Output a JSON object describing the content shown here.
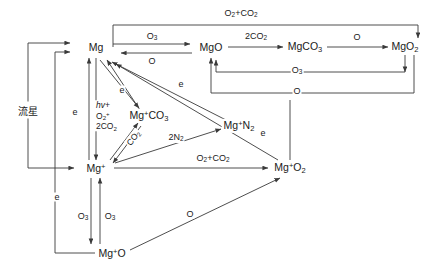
{
  "diagram": {
    "background_color": "#ffffff",
    "line_color": "#3a3a3a",
    "text_color": "#1a1a1a",
    "nodes": [
      {
        "id": "mg",
        "label": "Mg",
        "x": 96,
        "y": 47
      },
      {
        "id": "mgo",
        "label": "MgO",
        "x": 211,
        "y": 47
      },
      {
        "id": "mgco3",
        "label": "MgCO3",
        "x": 305,
        "y": 47
      },
      {
        "id": "mgo2",
        "label": "MgO2",
        "x": 405,
        "y": 47
      },
      {
        "id": "mgpco3",
        "label": "Mg+CO3",
        "x": 149,
        "y": 116
      },
      {
        "id": "mgpn2",
        "label": "Mg+N2",
        "x": 239,
        "y": 126
      },
      {
        "id": "mgp",
        "label": "Mg+",
        "x": 96,
        "y": 168
      },
      {
        "id": "mgpo2",
        "label": "Mg+O2",
        "x": 290,
        "y": 168
      },
      {
        "id": "mgpo",
        "label": "Mg+O",
        "x": 112,
        "y": 253
      }
    ],
    "meteor_label": "流星",
    "edge_labels": [
      {
        "id": "top-o2co2",
        "label": "O2+CO2",
        "x": 241,
        "y": 14
      },
      {
        "id": "mg-mgo",
        "label": "O3",
        "x": 152,
        "y": 38
      },
      {
        "id": "mgo-mg",
        "label": "O",
        "x": 152,
        "y": 59
      },
      {
        "id": "mgo-mgco3",
        "label": "2CO2",
        "x": 256,
        "y": 38
      },
      {
        "id": "mgco3-mgo2",
        "label": "O",
        "x": 357,
        "y": 38
      },
      {
        "id": "mgo2-mgco3-o3",
        "label": "O3",
        "x": 295,
        "y": 66
      },
      {
        "id": "mgo2-mgo-o",
        "label": "O",
        "x": 295,
        "y": 86
      },
      {
        "id": "e-left-upper",
        "label": "e",
        "x": 74,
        "y": 112
      },
      {
        "id": "e-diag-near",
        "label": "e",
        "x": 121,
        "y": 89
      },
      {
        "id": "e-diag-far",
        "label": "e",
        "x": 181,
        "y": 85
      },
      {
        "id": "e-right",
        "label": "e",
        "x": 262,
        "y": 133
      },
      {
        "id": "e-lower-left",
        "label": "e",
        "x": 57,
        "y": 197
      },
      {
        "id": "co2-slant",
        "label": "CO2",
        "x": 139,
        "y": 145
      },
      {
        "id": "n2-label",
        "label": "2N2",
        "x": 175,
        "y": 139
      },
      {
        "id": "o2co2-lower",
        "label": "O2+CO2",
        "x": 213,
        "y": 160
      },
      {
        "id": "o3-left-down",
        "label": "O3",
        "x": 84,
        "y": 217
      },
      {
        "id": "o3-right-up",
        "label": "O3",
        "x": 110,
        "y": 217
      },
      {
        "id": "o-bottom",
        "label": "O",
        "x": 190,
        "y": 214
      }
    ],
    "stack_label": {
      "id": "photoionization-stack",
      "lines": [
        "hv+",
        "O2+",
        "2CO2"
      ],
      "x": 102,
      "y": 116
    }
  }
}
